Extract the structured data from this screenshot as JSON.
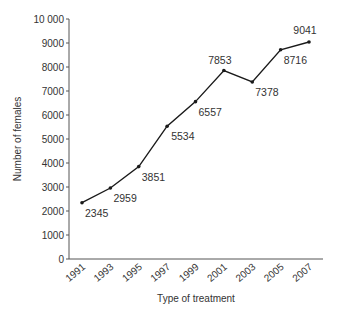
{
  "chart_data": {
    "type": "line",
    "title": "",
    "xlabel": "Type of treatment",
    "ylabel": "Number of females",
    "categories": [
      "1991",
      "1993",
      "1995",
      "1997",
      "1999",
      "2001",
      "2003",
      "2005",
      "2007"
    ],
    "series": [
      {
        "name": "Number of females",
        "values": [
          2345,
          2959,
          3851,
          5534,
          6557,
          7853,
          7378,
          8716,
          9041
        ]
      }
    ],
    "data_labels": [
      "2345",
      "2959",
      "3851",
      "5534",
      "6557",
      "7853",
      "7378",
      "8716",
      "9041"
    ],
    "yticks": [
      0,
      1000,
      2000,
      3000,
      4000,
      5000,
      6000,
      7000,
      8000,
      9000,
      10000
    ],
    "ytick_labels": [
      "0",
      "1000",
      "2000",
      "3000",
      "4000",
      "5000",
      "6000",
      "7000",
      "8000",
      "9000",
      "10 000"
    ],
    "ylim": [
      0,
      10000
    ],
    "grid": false,
    "legend": "none",
    "colors": {
      "line": "#1a1a1a",
      "axis": "#555555",
      "text": "#333333"
    }
  }
}
